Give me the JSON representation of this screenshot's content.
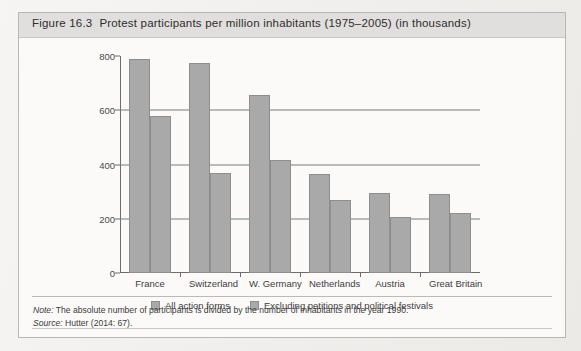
{
  "figure": {
    "number": "Figure 16.3",
    "title": "Protest participants per million inhabitants (1975–2005) (in thousands)"
  },
  "legend": {
    "items": [
      {
        "label": "All action forms",
        "color": "#a9a9a9"
      },
      {
        "label": "Excluding petitions and political festivals",
        "color": "#a9a9a9"
      }
    ]
  },
  "footer": {
    "note_label": "Note:",
    "note_text": " The absolute number of participants is divided by the number of inhabitants in the year 1990.",
    "source_label": "Source:",
    "source_text": " Hutter (2014: 67)."
  },
  "chart_data": {
    "type": "bar",
    "title": "Protest participants per million inhabitants (1975–2005) (in thousands)",
    "xlabel": "",
    "ylabel": "",
    "ylim": [
      0,
      800
    ],
    "yticks": [
      0,
      200,
      400,
      600,
      800
    ],
    "grid": true,
    "legend_position": "bottom",
    "categories": [
      "France",
      "Switzerland",
      "W. Germany",
      "Netherlands",
      "Austria",
      "Great Britain"
    ],
    "series": [
      {
        "name": "All action forms",
        "values": [
          790,
          775,
          655,
          365,
          295,
          292
        ],
        "color": "#a9a9a9"
      },
      {
        "name": "Excluding petitions and political festivals",
        "values": [
          580,
          370,
          415,
          270,
          205,
          220
        ],
        "color": "#a9a9a9"
      }
    ]
  }
}
